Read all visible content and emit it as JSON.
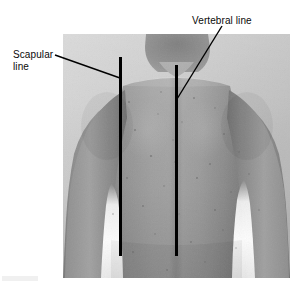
{
  "figure": {
    "kind": "anatomy-photograph-annotated",
    "width": 302,
    "height": 285,
    "background_color": "#ffffff"
  },
  "photo": {
    "x": 63,
    "y": 34,
    "width": 227,
    "height": 244,
    "backdrop_color": "#cfcfcf",
    "skin_color": "#9a9a9a",
    "shadow_color": "#6e6e6e",
    "highlight_color": "#f2f2f2"
  },
  "labels": [
    {
      "id": "scapular",
      "text": "Scapular\nline",
      "line1": "Scapular",
      "line2": "line",
      "x": 13,
      "y": 49,
      "color": "#0a0a0a",
      "leader": {
        "x1": 55,
        "y1": 55,
        "x2": 120,
        "y2": 78
      }
    },
    {
      "id": "vertebral",
      "text": "Vertebral line",
      "line1": "Vertebral line",
      "line2": "",
      "x": 192,
      "y": 15,
      "color": "#0a0a0a",
      "leader": {
        "x1": 222,
        "y1": 26,
        "x2": 177,
        "y2": 99
      }
    }
  ],
  "reference_lines": [
    {
      "id": "scapular-line",
      "name": "Scapular line",
      "x": 120,
      "y_top": 57,
      "y_bottom": 256,
      "thickness": 3,
      "color": "#000000"
    },
    {
      "id": "vertebral-line",
      "name": "Vertebral line",
      "x": 176,
      "y_top": 65,
      "y_bottom": 256,
      "thickness": 3,
      "color": "#000000"
    }
  ]
}
